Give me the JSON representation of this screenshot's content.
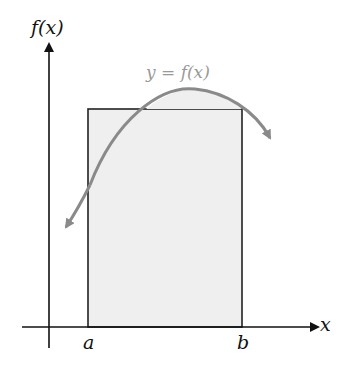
{
  "diagram": {
    "y_axis_label": "f(x)",
    "x_axis_label": "x",
    "curve_label": "y = f(x)",
    "a_label": "a",
    "b_label": "b"
  },
  "colors": {
    "axis": "#111111",
    "rectangle_fill": "#efefef",
    "rectangle_stroke": "#222222",
    "curve": "#8a8a8a",
    "curve_label": "#999999"
  }
}
